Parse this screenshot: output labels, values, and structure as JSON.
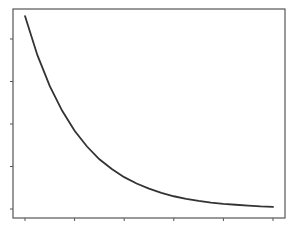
{
  "chart_data": {
    "type": "line",
    "title": "",
    "xlabel": "",
    "ylabel": "",
    "grid": false,
    "legend": null,
    "x_ticks": [
      0,
      1,
      2,
      3,
      4,
      5
    ],
    "y_ticks": [
      0,
      1,
      2,
      3,
      4
    ],
    "x_tick_labels": [],
    "y_tick_labels": [],
    "xlim": [
      -0.25,
      5.25
    ],
    "ylim": [
      -0.2,
      4.75
    ],
    "series": [
      {
        "name": "exponential decay",
        "color": "#333333",
        "x": [
          0,
          0.25,
          0.5,
          0.75,
          1,
          1.25,
          1.5,
          1.75,
          2,
          2.25,
          2.5,
          2.75,
          3,
          3.25,
          3.5,
          3.75,
          4,
          4.25,
          4.5,
          4.75,
          5
        ],
        "y": [
          4.54,
          3.62,
          2.89,
          2.31,
          1.84,
          1.47,
          1.17,
          0.94,
          0.75,
          0.6,
          0.48,
          0.38,
          0.3,
          0.24,
          0.19,
          0.15,
          0.12,
          0.1,
          0.08,
          0.06,
          0.05
        ]
      }
    ]
  },
  "style": {
    "frame_color": "#555555",
    "line_color": "#333333",
    "background": "#ffffff"
  }
}
